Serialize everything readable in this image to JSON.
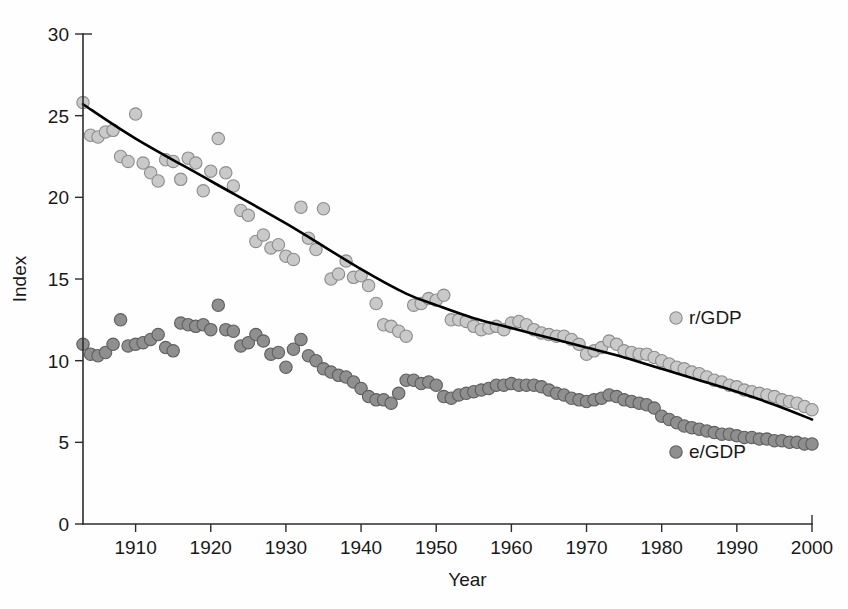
{
  "chart_data": {
    "type": "scatter",
    "title": "",
    "xlabel": "Year",
    "ylabel": "Index",
    "xlim": [
      1903,
      2000
    ],
    "ylim": [
      0,
      30
    ],
    "xticks": [
      1910,
      1920,
      1930,
      1940,
      1950,
      1960,
      1970,
      1980,
      1990,
      2000
    ],
    "yticks": [
      0,
      5,
      10,
      15,
      20,
      25,
      30
    ],
    "grid": false,
    "legend_position": "inside-right",
    "series": [
      {
        "name": "r/GDP",
        "marker": "circle",
        "color": "#c9c9c9",
        "edge_color": "#8c8c8c",
        "x": [
          1903,
          1904,
          1905,
          1906,
          1907,
          1908,
          1909,
          1910,
          1911,
          1912,
          1913,
          1914,
          1915,
          1916,
          1917,
          1918,
          1919,
          1920,
          1921,
          1922,
          1923,
          1924,
          1925,
          1926,
          1927,
          1928,
          1929,
          1930,
          1931,
          1932,
          1933,
          1934,
          1935,
          1936,
          1937,
          1938,
          1939,
          1940,
          1941,
          1942,
          1943,
          1944,
          1945,
          1946,
          1947,
          1948,
          1949,
          1950,
          1951,
          1952,
          1953,
          1954,
          1955,
          1956,
          1957,
          1958,
          1959,
          1960,
          1961,
          1962,
          1963,
          1964,
          1965,
          1966,
          1967,
          1968,
          1969,
          1970,
          1971,
          1972,
          1973,
          1974,
          1975,
          1976,
          1977,
          1978,
          1979,
          1980,
          1981,
          1982,
          1983,
          1984,
          1985,
          1986,
          1987,
          1988,
          1989,
          1990,
          1991,
          1992,
          1993,
          1994,
          1995,
          1996,
          1997,
          1998,
          1999,
          2000
        ],
        "y": [
          25.8,
          23.8,
          23.7,
          24.0,
          24.1,
          22.5,
          22.2,
          25.1,
          22.1,
          21.5,
          21.0,
          22.3,
          22.2,
          21.1,
          22.4,
          22.1,
          20.4,
          21.6,
          23.6,
          21.5,
          20.7,
          19.2,
          18.9,
          17.3,
          17.7,
          16.9,
          17.1,
          16.4,
          16.2,
          19.4,
          17.5,
          16.8,
          19.3,
          15.0,
          15.3,
          16.1,
          15.1,
          15.2,
          14.6,
          13.5,
          12.2,
          12.1,
          11.8,
          11.5,
          13.4,
          13.5,
          13.8,
          13.7,
          14.0,
          12.5,
          12.5,
          12.4,
          12.1,
          11.9,
          12.0,
          12.1,
          11.9,
          12.3,
          12.4,
          12.2,
          11.9,
          11.7,
          11.6,
          11.5,
          11.5,
          11.3,
          11.0,
          10.4,
          10.6,
          10.8,
          11.2,
          11.0,
          10.6,
          10.5,
          10.4,
          10.4,
          10.2,
          10.0,
          9.8,
          9.6,
          9.5,
          9.3,
          9.2,
          9.0,
          8.8,
          8.7,
          8.5,
          8.4,
          8.2,
          8.1,
          8.0,
          7.9,
          7.8,
          7.6,
          7.5,
          7.4,
          7.2,
          7.0
        ]
      },
      {
        "name": "e/GDP",
        "marker": "circle",
        "color": "#8f8f8f",
        "edge_color": "#5e5e5e",
        "x": [
          1903,
          1904,
          1905,
          1906,
          1907,
          1908,
          1909,
          1910,
          1911,
          1912,
          1913,
          1914,
          1915,
          1916,
          1917,
          1918,
          1919,
          1920,
          1921,
          1922,
          1923,
          1924,
          1925,
          1926,
          1927,
          1928,
          1929,
          1930,
          1931,
          1932,
          1933,
          1934,
          1935,
          1936,
          1937,
          1938,
          1939,
          1940,
          1941,
          1942,
          1943,
          1944,
          1945,
          1946,
          1947,
          1948,
          1949,
          1950,
          1951,
          1952,
          1953,
          1954,
          1955,
          1956,
          1957,
          1958,
          1959,
          1960,
          1961,
          1962,
          1963,
          1964,
          1965,
          1966,
          1967,
          1968,
          1969,
          1970,
          1971,
          1972,
          1973,
          1974,
          1975,
          1976,
          1977,
          1978,
          1979,
          1980,
          1981,
          1982,
          1983,
          1984,
          1985,
          1986,
          1987,
          1988,
          1989,
          1990,
          1991,
          1992,
          1993,
          1994,
          1995,
          1996,
          1997,
          1998,
          1999,
          2000
        ],
        "y": [
          11.0,
          10.4,
          10.3,
          10.5,
          11.0,
          12.5,
          10.9,
          11.0,
          11.1,
          11.3,
          11.6,
          10.8,
          10.6,
          12.3,
          12.2,
          12.1,
          12.2,
          11.9,
          13.4,
          11.9,
          11.8,
          10.9,
          11.1,
          11.6,
          11.2,
          10.4,
          10.5,
          9.6,
          10.7,
          11.3,
          10.3,
          10.0,
          9.5,
          9.3,
          9.1,
          9.0,
          8.7,
          8.3,
          7.8,
          7.6,
          7.6,
          7.4,
          8.0,
          8.8,
          8.8,
          8.6,
          8.7,
          8.5,
          7.8,
          7.7,
          7.9,
          8.0,
          8.1,
          8.2,
          8.3,
          8.5,
          8.5,
          8.6,
          8.5,
          8.5,
          8.5,
          8.4,
          8.2,
          8.0,
          7.9,
          7.7,
          7.6,
          7.5,
          7.6,
          7.7,
          7.9,
          7.8,
          7.6,
          7.5,
          7.4,
          7.3,
          7.1,
          6.6,
          6.4,
          6.2,
          6.0,
          5.9,
          5.8,
          5.7,
          5.6,
          5.5,
          5.5,
          5.4,
          5.3,
          5.3,
          5.2,
          5.2,
          5.1,
          5.1,
          5.0,
          5.0,
          4.9,
          4.9
        ]
      }
    ],
    "trend": {
      "name": "r/GDP trend",
      "color": "#000000",
      "x": [
        1903,
        1910,
        1920,
        1930,
        1940,
        1946,
        1950,
        1955,
        1960,
        1965,
        1970,
        1975,
        1980,
        1985,
        1990,
        1995,
        2000
      ],
      "y": [
        25.7,
        23.6,
        21.0,
        18.4,
        15.6,
        14.1,
        13.4,
        12.6,
        12.0,
        11.4,
        10.8,
        10.2,
        9.5,
        8.8,
        8.1,
        7.3,
        6.4
      ]
    },
    "legend": [
      {
        "label": "r/GDP",
        "color": "#c9c9c9",
        "edge_color": "#8c8c8c"
      },
      {
        "label": "e/GDP",
        "color": "#8f8f8f",
        "edge_color": "#5e5e5e"
      }
    ]
  }
}
